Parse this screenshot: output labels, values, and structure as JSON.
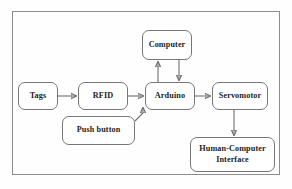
{
  "figure": {
    "type": "block-diagram",
    "frame": {
      "visible": true,
      "border_color": "#8d8d8d"
    },
    "background_color": "#fefefe",
    "line_color": "#6f6f6f",
    "text_color": "#1d1d1d"
  },
  "nodes": [
    {
      "id": "tags",
      "label": "Tags",
      "x": 18,
      "y": 82,
      "w": 40,
      "h": 28
    },
    {
      "id": "rfid",
      "label": "RFID",
      "x": 78,
      "y": 82,
      "w": 50,
      "h": 28
    },
    {
      "id": "arduino",
      "label": "Arduino",
      "x": 145,
      "y": 82,
      "w": 50,
      "h": 28
    },
    {
      "id": "servomotor",
      "label": "Servomotor",
      "x": 212,
      "y": 82,
      "w": 56,
      "h": 28
    },
    {
      "id": "computer",
      "label": "Computer",
      "x": 142,
      "y": 30,
      "w": 50,
      "h": 30
    },
    {
      "id": "pushbutton",
      "label": "Push button",
      "x": 62,
      "y": 116,
      "w": 73,
      "h": 29
    },
    {
      "id": "hci",
      "label": "Human-Computer\nInterface",
      "x": 190,
      "y": 137,
      "w": 85,
      "h": 35
    }
  ],
  "edges": [
    {
      "id": "tags-to-rfid",
      "from": "tags",
      "to": "rfid",
      "direction": "forward"
    },
    {
      "id": "rfid-to-arduino",
      "from": "rfid",
      "to": "arduino",
      "direction": "forward"
    },
    {
      "id": "arduino-to-computer",
      "from": "arduino",
      "to": "computer",
      "direction": "forward"
    },
    {
      "id": "computer-to-arduino",
      "from": "computer",
      "to": "arduino",
      "direction": "forward"
    },
    {
      "id": "arduino-to-servomotor",
      "from": "arduino",
      "to": "servomotor",
      "direction": "forward"
    },
    {
      "id": "servomotor-to-hci",
      "from": "servomotor",
      "to": "hci",
      "direction": "forward"
    },
    {
      "id": "pushbutton-to-arduino",
      "from": "pushbutton",
      "to": "arduino",
      "direction": "forward"
    }
  ]
}
